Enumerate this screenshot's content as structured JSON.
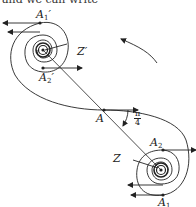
{
  "header_text": "and we can write",
  "labels": {
    "A1p": {
      "main": "A",
      "sub": "1",
      "prime": "′"
    },
    "A2p": {
      "main": "A",
      "sub": "2",
      "prime": "′"
    },
    "Zp": "Z′",
    "A": "A",
    "Z": "Z",
    "A2": {
      "main": "A",
      "sub": "2"
    },
    "A1": {
      "main": "A",
      "sub": "1"
    },
    "angle": {
      "num": "π",
      "den": "4"
    }
  },
  "colors": {
    "stroke": "#222222",
    "background": "#ffffff"
  },
  "icons": {
    "rotation_arrow": "counterclockwise-arrow-icon"
  }
}
